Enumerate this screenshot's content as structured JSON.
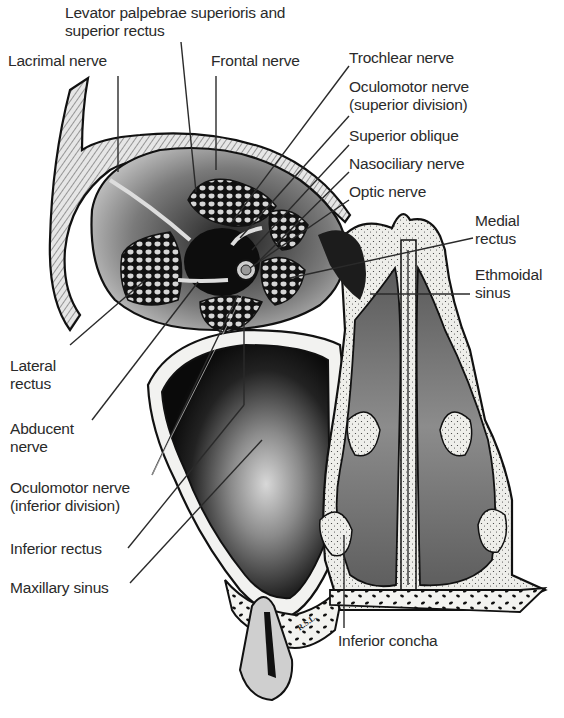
{
  "figure": {
    "artist_signature": "R.S.L.",
    "colors": {
      "background": "#ffffff",
      "ink": "#111111",
      "bone": "#f2f2f0",
      "cavity_gray": "#6e6e6e",
      "sinus_dark": "#1c1c1c",
      "label_text": "#2a2a2a"
    }
  },
  "labels": {
    "levator": {
      "line1": "Levator palpebrae superioris and",
      "line2": "superior rectus"
    },
    "lacrimal_nerve": {
      "line1": "Lacrimal nerve"
    },
    "frontal_nerve": {
      "line1": "Frontal nerve"
    },
    "trochlear_nerve": {
      "line1": "Trochlear nerve"
    },
    "oculomotor_superior": {
      "line1": "Oculomotor nerve",
      "line2": "(superior division)"
    },
    "superior_oblique": {
      "line1": "Superior oblique"
    },
    "nasociliary_nerve": {
      "line1": "Nasociliary nerve"
    },
    "optic_nerve": {
      "line1": "Optic nerve"
    },
    "medial_rectus": {
      "line1": "Medial",
      "line2": "rectus"
    },
    "ethmoidal_sinus": {
      "line1": "Ethmoidal",
      "line2": "sinus"
    },
    "lateral_rectus": {
      "line1": "Lateral",
      "line2": "rectus"
    },
    "abducent_nerve": {
      "line1": "Abducent",
      "line2": "nerve"
    },
    "oculomotor_inferior": {
      "line1": "Oculomotor nerve",
      "line2": "(inferior division)"
    },
    "inferior_rectus": {
      "line1": "Inferior rectus"
    },
    "maxillary_sinus": {
      "line1": "Maxillary sinus"
    },
    "inferior_concha": {
      "line1": "Inferior concha"
    }
  }
}
